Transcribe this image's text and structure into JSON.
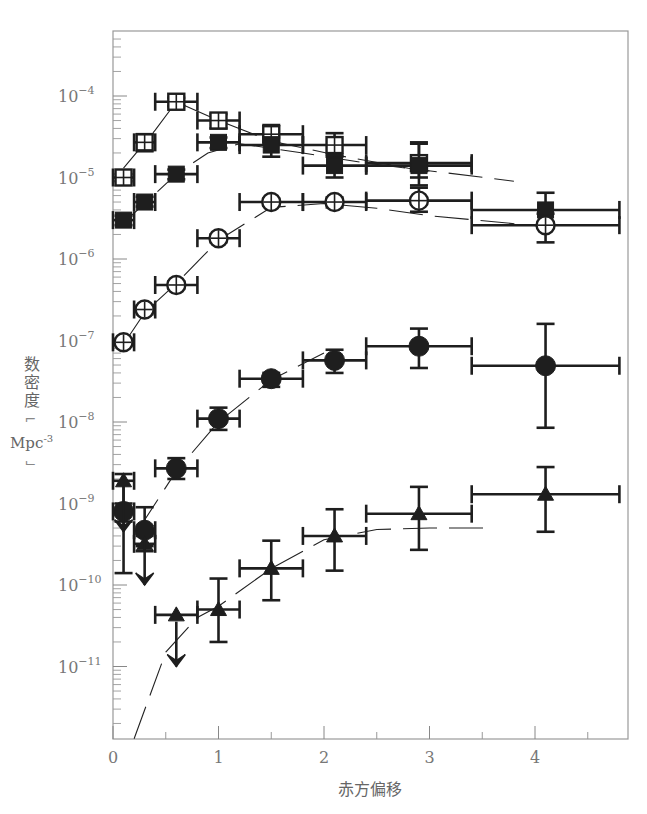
{
  "chart_data": {
    "type": "scatter",
    "title": "",
    "xlabel": "赤方偏移",
    "ylabel": "数密度",
    "ylabel_unit": "Mpc",
    "ylabel_unit_exp": "-3",
    "xlim": [
      0,
      4.85
    ],
    "ylim_log10": [
      -11.89,
      -3.2
    ],
    "yscale": "log",
    "grid": false,
    "legend": "none",
    "x_ticks": [
      0,
      1,
      2,
      3,
      4
    ],
    "x_tick_labels": [
      "0",
      "1",
      "2",
      "3",
      "4"
    ],
    "x_minor_ticks": [
      0.5,
      1.5,
      2.5,
      3.5,
      4.5
    ],
    "y_ticks_log10": [
      -4,
      -5,
      -6,
      -7,
      -8,
      -9,
      -10,
      -11
    ],
    "y_tick_labels": [
      {
        "base": "10",
        "exp": "−4"
      },
      {
        "base": "10",
        "exp": "−5"
      },
      {
        "base": "10",
        "exp": "−6"
      },
      {
        "base": "10",
        "exp": "−7"
      },
      {
        "base": "10",
        "exp": "−8"
      },
      {
        "base": "10",
        "exp": "−9"
      },
      {
        "base": "10",
        "exp": "−10"
      },
      {
        "base": "10",
        "exp": "−11"
      }
    ],
    "series": [
      {
        "name": "open-squares",
        "marker": "square-open",
        "points": [
          {
            "x": 0.1,
            "xlo": 0.0,
            "xhi": 0.2,
            "y": 1e-05,
            "ylo": 9e-06,
            "yhi": 1.1e-05
          },
          {
            "x": 0.3,
            "xlo": 0.2,
            "xhi": 0.4,
            "y": 2.7e-05,
            "ylo": 2.1e-05,
            "yhi": 3.4e-05
          },
          {
            "x": 0.6,
            "xlo": 0.4,
            "xhi": 0.8,
            "y": 8.5e-05,
            "ylo": 7.5e-05,
            "yhi": 9.5e-05
          },
          {
            "x": 1.0,
            "xlo": 0.8,
            "xhi": 1.2,
            "y": 5e-05,
            "ylo": 4e-05,
            "yhi": 6e-05
          },
          {
            "x": 1.5,
            "xlo": 1.2,
            "xhi": 1.8,
            "y": 3.4e-05,
            "ylo": 2.6e-05,
            "yhi": 4.4e-05
          },
          {
            "x": 2.1,
            "xlo": 1.8,
            "xhi": 2.4,
            "y": 2.5e-05,
            "ylo": 1.8e-05,
            "yhi": 3.5e-05
          },
          {
            "x": 2.9,
            "xlo": 2.4,
            "xhi": 3.4,
            "y": 1.5e-05,
            "ylo": 1e-05,
            "yhi": 2.6e-05
          }
        ]
      },
      {
        "name": "filled-squares",
        "marker": "square-filled",
        "points": [
          {
            "x": 0.1,
            "xlo": 0.0,
            "xhi": 0.2,
            "y": 3e-06,
            "ylo": 2.6e-06,
            "yhi": 3.4e-06
          },
          {
            "x": 0.3,
            "xlo": 0.2,
            "xhi": 0.4,
            "y": 5e-06,
            "ylo": 4.4e-06,
            "yhi": 5.8e-06
          },
          {
            "x": 0.6,
            "xlo": 0.4,
            "xhi": 0.8,
            "y": 1.1e-05,
            "ylo": 9.5e-06,
            "yhi": 1.25e-05
          },
          {
            "x": 1.0,
            "xlo": 0.8,
            "xhi": 1.2,
            "y": 2.7e-05,
            "ylo": 2.3e-05,
            "yhi": 3.1e-05
          },
          {
            "x": 1.5,
            "xlo": 1.2,
            "xhi": 1.8,
            "y": 2.5e-05,
            "ylo": 1.8e-05,
            "yhi": 3.1e-05
          },
          {
            "x": 2.1,
            "xlo": 1.8,
            "xhi": 2.4,
            "y": 1.4e-05,
            "ylo": 1e-05,
            "yhi": 1.9e-05
          },
          {
            "x": 2.9,
            "xlo": 2.4,
            "xhi": 3.4,
            "y": 1.4e-05,
            "ylo": 8e-06,
            "yhi": 2.7e-05
          },
          {
            "x": 4.1,
            "xlo": 3.4,
            "xhi": 4.8,
            "y": 4e-06,
            "ylo": 2.8e-06,
            "yhi": 6.5e-06
          }
        ]
      },
      {
        "name": "open-circles",
        "marker": "circle-open",
        "points": [
          {
            "x": 0.1,
            "xlo": 0.0,
            "xhi": 0.2,
            "y": 9.5e-08,
            "ylo": 8.5e-08,
            "yhi": 1.05e-07
          },
          {
            "x": 0.3,
            "xlo": 0.2,
            "xhi": 0.4,
            "y": 2.4e-07,
            "ylo": 2.1e-07,
            "yhi": 2.7e-07
          },
          {
            "x": 0.6,
            "xlo": 0.4,
            "xhi": 0.8,
            "y": 4.8e-07,
            "ylo": 4.3e-07,
            "yhi": 5.3e-07
          },
          {
            "x": 1.0,
            "xlo": 0.8,
            "xhi": 1.2,
            "y": 1.8e-06,
            "ylo": 1.6e-06,
            "yhi": 2e-06
          },
          {
            "x": 1.5,
            "xlo": 1.2,
            "xhi": 1.8,
            "y": 5e-06,
            "ylo": 4.5e-06,
            "yhi": 5.5e-06
          },
          {
            "x": 2.1,
            "xlo": 1.8,
            "xhi": 2.4,
            "y": 5e-06,
            "ylo": 4.3e-06,
            "yhi": 5.7e-06
          },
          {
            "x": 2.9,
            "xlo": 2.4,
            "xhi": 3.4,
            "y": 5.2e-06,
            "ylo": 3.8e-06,
            "yhi": 7.5e-06
          },
          {
            "x": 4.1,
            "xlo": 3.4,
            "xhi": 4.8,
            "y": 2.6e-06,
            "ylo": 1.6e-06,
            "yhi": 3.6e-06
          }
        ]
      },
      {
        "name": "filled-circles",
        "marker": "circle-filled",
        "points": [
          {
            "x": 0.1,
            "xlo": 0.0,
            "xhi": 0.2,
            "y": 8e-10,
            "ylo": 6e-10,
            "yhi": 1e-09
          },
          {
            "x": 0.3,
            "xlo": 0.2,
            "xhi": 0.4,
            "y": 4.7e-10,
            "ylo": 3e-10,
            "yhi": 9e-10
          },
          {
            "x": 0.6,
            "xlo": 0.4,
            "xhi": 0.8,
            "y": 2.7e-09,
            "ylo": 2e-09,
            "yhi": 3.6e-09
          },
          {
            "x": 1.0,
            "xlo": 0.8,
            "xhi": 1.2,
            "y": 1.1e-08,
            "ylo": 8e-09,
            "yhi": 1.5e-08
          },
          {
            "x": 1.5,
            "xlo": 1.2,
            "xhi": 1.8,
            "y": 3.4e-08,
            "ylo": 2.7e-08,
            "yhi": 4e-08
          },
          {
            "x": 2.1,
            "xlo": 1.8,
            "xhi": 2.4,
            "y": 5.7e-08,
            "ylo": 4e-08,
            "yhi": 7.7e-08
          },
          {
            "x": 2.9,
            "xlo": 2.4,
            "xhi": 3.4,
            "y": 8.5e-08,
            "ylo": 4.6e-08,
            "yhi": 1.4e-07
          },
          {
            "x": 4.1,
            "xlo": 3.4,
            "xhi": 4.8,
            "y": 4.9e-08,
            "ylo": 8.5e-09,
            "yhi": 1.6e-07
          }
        ]
      },
      {
        "name": "filled-triangles",
        "marker": "triangle-filled",
        "points": [
          {
            "x": 0.1,
            "xlo": 0.0,
            "xhi": 0.2,
            "y": 1.9e-09,
            "ylo": 1.4e-10,
            "yhi": 2.3e-09,
            "upper_limit": false
          },
          {
            "x": 0.1,
            "xlo": 0.1,
            "xhi": 0.1,
            "y": 4.5e-10,
            "upper_limit": true
          },
          {
            "x": 0.3,
            "xlo": 0.2,
            "xhi": 0.4,
            "y": 3.2e-10,
            "ylo": 2.6e-10,
            "yhi": 4e-10,
            "upper_limit": false
          },
          {
            "x": 0.3,
            "xlo": 0.3,
            "xhi": 0.3,
            "y": 1e-10,
            "upper_limit": true
          },
          {
            "x": 0.6,
            "xlo": 0.4,
            "xhi": 0.8,
            "y": 4.3e-11,
            "upper_limit": false
          },
          {
            "x": 0.6,
            "xlo": 0.6,
            "xhi": 0.6,
            "y": 1e-11,
            "upper_limit": true
          },
          {
            "x": 1.0,
            "xlo": 0.8,
            "xhi": 1.2,
            "y": 5e-11,
            "ylo": 2e-11,
            "yhi": 1.2e-10,
            "upper_limit": false
          },
          {
            "x": 1.5,
            "xlo": 1.2,
            "xhi": 1.8,
            "y": 1.6e-10,
            "ylo": 6.5e-11,
            "yhi": 3.5e-10,
            "upper_limit": false
          },
          {
            "x": 2.1,
            "xlo": 1.8,
            "xhi": 2.4,
            "y": 4e-10,
            "ylo": 1.5e-10,
            "yhi": 8.5e-10,
            "upper_limit": false
          },
          {
            "x": 2.9,
            "xlo": 2.4,
            "xhi": 3.4,
            "y": 7.5e-10,
            "ylo": 2.7e-10,
            "yhi": 1.6e-09,
            "upper_limit": false
          },
          {
            "x": 4.1,
            "xlo": 3.4,
            "xhi": 4.8,
            "y": 1.3e-09,
            "ylo": 4.5e-10,
            "yhi": 2.8e-09,
            "upper_limit": false
          }
        ]
      }
    ],
    "model_curves": [
      {
        "name": "open-squares-model",
        "style": "dashed",
        "points": [
          [
            0.1,
            1.3e-05
          ],
          [
            0.4,
            3.8e-05
          ],
          [
            0.6,
            8.5e-05
          ],
          [
            1.0,
            5e-05
          ],
          [
            1.5,
            2.8e-05
          ],
          [
            2.1,
            1.9e-05
          ],
          [
            2.8,
            1.3e-05
          ],
          [
            3.8,
            9e-06
          ]
        ]
      },
      {
        "name": "filled-squares-model",
        "style": "dashed",
        "points": [
          [
            0.1,
            2.8e-06
          ],
          [
            0.3,
            4.8e-06
          ],
          [
            0.6,
            1.1e-05
          ],
          [
            0.9,
            2e-05
          ],
          [
            1.2,
            2.6e-05
          ],
          [
            1.8,
            2e-05
          ],
          [
            2.4,
            1.5e-05
          ],
          [
            3.0,
            1.2e-05
          ]
        ]
      },
      {
        "name": "open-circles-model",
        "style": "dashed",
        "points": [
          [
            0.1,
            9e-08
          ],
          [
            0.3,
            2.2e-07
          ],
          [
            0.6,
            5e-07
          ],
          [
            1.0,
            1.7e-06
          ],
          [
            1.5,
            4.3e-06
          ],
          [
            2.0,
            4.8e-06
          ],
          [
            2.5,
            4.2e-06
          ],
          [
            3.0,
            3.4e-06
          ],
          [
            4.1,
            2.5e-06
          ]
        ]
      },
      {
        "name": "filled-circles-model",
        "style": "dashed",
        "points": [
          [
            0.25,
            5e-10
          ],
          [
            0.6,
            2.5e-09
          ],
          [
            1.0,
            1e-08
          ],
          [
            1.5,
            3.3e-08
          ],
          [
            2.0,
            7e-08
          ]
        ]
      },
      {
        "name": "triangles-model",
        "style": "dashed",
        "points": [
          [
            0.2,
            1.3e-12
          ],
          [
            0.5,
            1.5e-11
          ],
          [
            0.8,
            4e-11
          ],
          [
            1.0,
            5.5e-11
          ],
          [
            1.5,
            1.6e-10
          ],
          [
            2.0,
            3.6e-10
          ],
          [
            2.5,
            4.8e-10
          ],
          [
            3.0,
            5e-10
          ],
          [
            3.6,
            5e-10
          ]
        ]
      }
    ]
  }
}
